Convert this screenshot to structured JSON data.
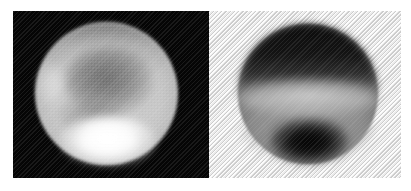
{
  "figure": {
    "width": 411,
    "height": 191,
    "background_color": "#ffffff",
    "caption": "",
    "panel_count": 2,
    "layout": "side-by-side"
  },
  "panels": [
    {
      "id": "left",
      "name": "positive-image",
      "label": "",
      "rendering": "positive grayscale",
      "background_color": "#050505",
      "background_description": "solid black field",
      "bounds": {
        "x": 13,
        "y": 11,
        "width": 196,
        "height": 167
      },
      "disc": {
        "center_x": 107,
        "center_y": 94,
        "radius": 71,
        "shape": "circle",
        "brightest_value": "#ffffff",
        "mean_value": "#c6c6c6",
        "darkest_value": "#000000"
      },
      "features": [
        {
          "name": "south-polar-cap",
          "description": "bright white polar cap at bottom of disc",
          "tone": "bright",
          "color": "#ffffff"
        },
        {
          "name": "dark-albedo-region",
          "description": "broad darker marking across the upper-middle of the disc",
          "tone": "dark",
          "color": "#5f5f5f"
        },
        {
          "name": "north-limb-shading",
          "description": "darkened limb along the top edge of the disc",
          "tone": "dark",
          "color": "#464646"
        },
        {
          "name": "west-limb-brightening",
          "description": "faint bright patch on the left limb",
          "tone": "bright",
          "color": "#ebebeb"
        }
      ],
      "texture": "coarse pixelation / halftone scan texture"
    },
    {
      "id": "right",
      "name": "negative-image",
      "label": "",
      "rendering": "inverted / negative grayscale",
      "background_color": "#e9e9e9",
      "background_description": "light grey ground with fine diagonal halftone hatching",
      "bounds": {
        "x": 209,
        "y": 11,
        "width": 192,
        "height": 167
      },
      "disc": {
        "center_x": 307,
        "center_y": 95,
        "radius": 70,
        "shape": "circle",
        "brightest_value": "#dedede",
        "mean_value": "#808080",
        "darkest_value": "#030303"
      },
      "features": [
        {
          "name": "north-dark-hemisphere",
          "description": "large very dark cap covering the upper half of the disc",
          "tone": "dark",
          "color": "#0c0c0c"
        },
        {
          "name": "mid-latitude-light-band",
          "description": "pale horizontal band across the middle of the disc",
          "tone": "bright",
          "color": "#dedede"
        },
        {
          "name": "south-polar-cap-inverted",
          "description": "intensely black blob at the bottom of the disc (inverted bright polar cap)",
          "tone": "dark",
          "color": "#030303"
        },
        {
          "name": "south-grey-hemisphere",
          "description": "mid grey lower hemisphere",
          "tone": "mid",
          "color": "#afafaf"
        }
      ],
      "texture": "fine 45-degree diagonal hatch halftone"
    }
  ],
  "colors": {
    "page_background": "#ffffff",
    "left_panel_background": "#050505",
    "right_panel_background": "#e9e9e9",
    "highlight": "#ffffff",
    "shadow": "#000000"
  }
}
